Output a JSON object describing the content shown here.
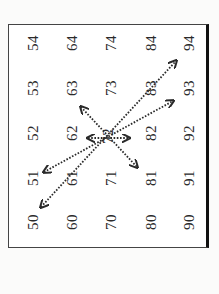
{
  "diagram": {
    "grid": {
      "rows": [
        [
          "50",
          "51",
          "52",
          "53",
          "54"
        ],
        [
          "60",
          "61",
          "62",
          "63",
          "64"
        ],
        [
          "70",
          "71",
          "72",
          "73",
          "74"
        ],
        [
          "80",
          "81",
          "82",
          "83",
          "84"
        ],
        [
          "90",
          "91",
          "92",
          "93",
          "94"
        ]
      ],
      "center_cell": "72"
    },
    "arrows": [
      {
        "from": "50",
        "to": "94",
        "style": "dotted",
        "heads": "both"
      },
      {
        "from": "51",
        "to": "93",
        "style": "dotted",
        "heads": "both"
      },
      {
        "from": "63",
        "to": "81",
        "style": "dotted",
        "heads": "both"
      },
      {
        "from": "71-side",
        "to": "73-side",
        "style": "dotted",
        "heads": "both",
        "note": "short arrow across center cell 72"
      }
    ],
    "colors": {
      "ink": "#2a2a2a",
      "background": "#ffffff",
      "border": "#111111"
    }
  }
}
